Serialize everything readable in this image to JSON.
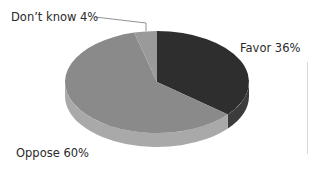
{
  "chart_data": {
    "type": "pie",
    "style": "3d",
    "title": "",
    "slices": [
      {
        "label": "Favor",
        "value": 36,
        "display": "Favor 36%",
        "color": "#2e2e2e",
        "side_color": "#3c3c3c"
      },
      {
        "label": "Oppose",
        "value": 60,
        "display": "Oppose 60%",
        "color": "#8a8a8a",
        "side_color": "#a9a9a9"
      },
      {
        "label": "Don't know",
        "value": 4,
        "display": "Don’t know 4%",
        "color": "#9a9a9a",
        "side_color": "#b0b0b0"
      }
    ],
    "start_angle_deg": 0,
    "direction": "clockwise",
    "legend": "none",
    "unit": "%"
  }
}
